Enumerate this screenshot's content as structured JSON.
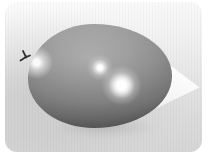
{
  "meta": {
    "type": "photograph",
    "page_background": "#ffffff"
  },
  "photo": {
    "corner_radius_px": 12,
    "background": {
      "top_color": "#fbfbfb",
      "bottom_color": "#d6d6d6",
      "left_shade_color": "#c9c9c9",
      "texture": "faint vertical striping"
    },
    "objects": {
      "balloon": {
        "label": "gray balloon on its side",
        "orientation": "knot at left, rounded end at right",
        "body_color": "#8f8f8f",
        "rim_shadow_color": "#353535",
        "highlight_color": "#ffffff",
        "highlight_count": 3,
        "knot_color": "#2e2e2e"
      },
      "paper_triangle": {
        "label": "white triangle pointing right",
        "color": "#fdfdfd",
        "position": "right side, partially behind balloon"
      }
    }
  }
}
